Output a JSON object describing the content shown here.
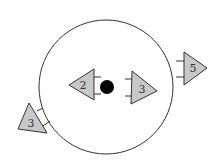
{
  "diagram": {
    "colors": {
      "stroke": "#333333",
      "triangle_fill": "#c8c8c8",
      "dot": "#000000",
      "background": "#ffffff"
    },
    "circle": {
      "cx": 106,
      "cy": 87,
      "r": 67
    },
    "center_dot": {
      "cx": 107,
      "cy": 87,
      "r": 7
    },
    "triangles": [
      {
        "id": "inner-left",
        "label": "2",
        "direction": "left"
      },
      {
        "id": "inner-right",
        "label": "3",
        "direction": "right"
      },
      {
        "id": "outer-right",
        "label": "5",
        "direction": "right"
      },
      {
        "id": "outer-bottom-left",
        "label": "3",
        "direction": "up-left"
      }
    ]
  }
}
